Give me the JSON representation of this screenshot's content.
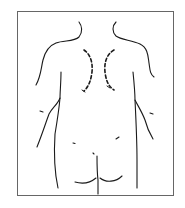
{
  "figure": {
    "annotation": "dashed lines marking medial borders of scapulae",
    "colors": {
      "background": "#ffffff",
      "line": "#1a1a1a",
      "frame": "#555555"
    },
    "caption": ""
  }
}
